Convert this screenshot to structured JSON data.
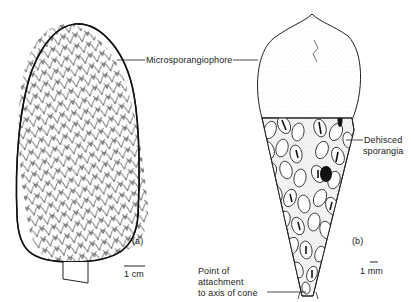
{
  "figure": {
    "panels": [
      {
        "id": "a",
        "panel_label": "(a)",
        "subject": "microsporangiate cone (external view)",
        "scale_bar_label": "1 cm"
      },
      {
        "id": "b",
        "panel_label": "(b)",
        "subject": "single microsporangiophore bearing sporangia",
        "scale_bar_label": "1 mm"
      }
    ],
    "labels": {
      "microsporangiophore": "Microsporangiophore",
      "dehisced_line1": "Dehisced",
      "dehisced_line2": "sporangia",
      "attach_line1": "Point  of",
      "attach_line2": "attachment",
      "attach_line3": "to axis of cone"
    },
    "colors": {
      "ink": "#1a1a1a",
      "background": "#ffffff",
      "stipple": "#bdbdbd"
    }
  }
}
